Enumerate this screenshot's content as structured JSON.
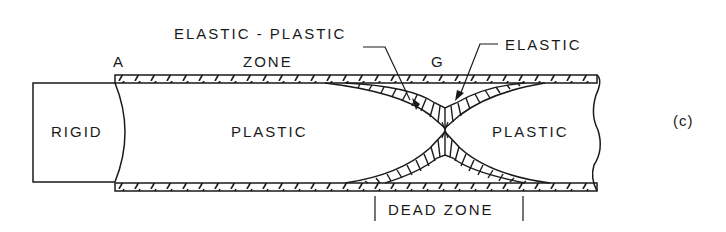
{
  "figure": {
    "panel_label": "(c)",
    "labels": {
      "point_a": "A",
      "point_g": "G",
      "elastic_plastic_line1": "ELASTIC - PLASTIC",
      "elastic_plastic_line2": "ZONE",
      "elastic": "ELASTIC",
      "rigid": "RIGID",
      "plastic_left": "PLASTIC",
      "plastic_right": "PLASTIC",
      "dead_zone": "DEAD ZONE"
    },
    "colors": {
      "ink": "#1a1a1a",
      "background": "#ffffff"
    }
  }
}
